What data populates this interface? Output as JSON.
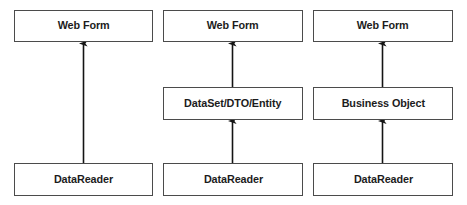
{
  "diagram": {
    "type": "layered-architecture-comparison",
    "background_color": "#ffffff",
    "box_border_color": "#4b4b4b",
    "box_fill_color": "#ffffff",
    "arrow_color": "#141414",
    "text_color": "#1c1c1c",
    "columns": [
      {
        "id": "col1",
        "name": "datareader-direct-to-web-form",
        "nodes": [
          {
            "id": "col1-top",
            "label": "Web Form",
            "row": "top"
          },
          {
            "id": "col1-bottom",
            "label": "DataReader",
            "row": "bottom"
          }
        ],
        "arrows": [
          {
            "from": "col1-bottom",
            "to": "col1-top",
            "direction": "up",
            "head": "filled-triangle"
          }
        ]
      },
      {
        "id": "col2",
        "name": "datareader-through-dataset",
        "nodes": [
          {
            "id": "col2-top",
            "label": "Web Form",
            "row": "top"
          },
          {
            "id": "col2-middle",
            "label": "DataSet/DTO/Entity",
            "row": "middle"
          },
          {
            "id": "col2-bottom",
            "label": "DataReader",
            "row": "bottom"
          }
        ],
        "arrows": [
          {
            "from": "col2-middle",
            "to": "col2-top",
            "direction": "up",
            "head": "filled-triangle"
          },
          {
            "from": "col2-bottom",
            "to": "col2-middle",
            "direction": "up",
            "head": "filled-triangle"
          }
        ]
      },
      {
        "id": "col3",
        "name": "datareader-through-business-object",
        "nodes": [
          {
            "id": "col3-top",
            "label": "Web Form",
            "row": "top"
          },
          {
            "id": "col3-middle",
            "label": "Business Object",
            "row": "middle"
          },
          {
            "id": "col3-bottom",
            "label": "DataReader",
            "row": "bottom"
          }
        ],
        "arrows": [
          {
            "from": "col3-middle",
            "to": "col3-top",
            "direction": "up",
            "head": "filled-triangle"
          },
          {
            "from": "col3-bottom",
            "to": "col3-middle",
            "direction": "up",
            "head": "filled-triangle"
          }
        ]
      }
    ]
  }
}
